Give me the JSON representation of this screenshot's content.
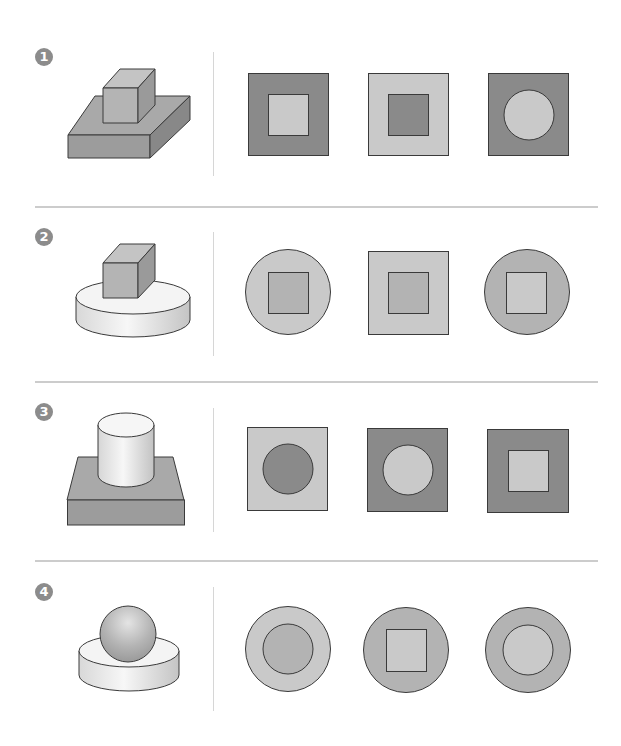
{
  "colors": {
    "dark": "#8a8a8a",
    "medium": "#b3b3b3",
    "light": "#c9c9c9",
    "stroke": "#3a3a3a",
    "divider": "#cccccc",
    "badge": "#8c8c8c"
  },
  "rows": [
    {
      "number": "1",
      "object": "cube on rectangular slab",
      "options": [
        {
          "outer": "square",
          "outer_fill": "dark",
          "inner": "square",
          "inner_fill": "light"
        },
        {
          "outer": "square",
          "outer_fill": "light",
          "inner": "square",
          "inner_fill": "dark"
        },
        {
          "outer": "square",
          "outer_fill": "dark",
          "inner": "circle",
          "inner_fill": "light"
        }
      ]
    },
    {
      "number": "2",
      "object": "cube on cylinder disk",
      "options": [
        {
          "outer": "circle",
          "outer_fill": "light",
          "inner": "square",
          "inner_fill": "medium"
        },
        {
          "outer": "square",
          "outer_fill": "light",
          "inner": "square",
          "inner_fill": "medium"
        },
        {
          "outer": "circle",
          "outer_fill": "medium",
          "inner": "square",
          "inner_fill": "light"
        }
      ]
    },
    {
      "number": "3",
      "object": "cylinder on square slab",
      "options": [
        {
          "outer": "square",
          "outer_fill": "light",
          "inner": "circle",
          "inner_fill": "dark"
        },
        {
          "outer": "square",
          "outer_fill": "dark",
          "inner": "circle",
          "inner_fill": "light"
        },
        {
          "outer": "square",
          "outer_fill": "dark",
          "inner": "square",
          "inner_fill": "light"
        }
      ]
    },
    {
      "number": "4",
      "object": "sphere on cylinder disk",
      "options": [
        {
          "outer": "circle",
          "outer_fill": "light",
          "inner": "circle",
          "inner_fill": "medium"
        },
        {
          "outer": "circle",
          "outer_fill": "medium",
          "inner": "square",
          "inner_fill": "light"
        },
        {
          "outer": "circle",
          "outer_fill": "medium",
          "inner": "circle",
          "inner_fill": "light"
        }
      ]
    }
  ]
}
